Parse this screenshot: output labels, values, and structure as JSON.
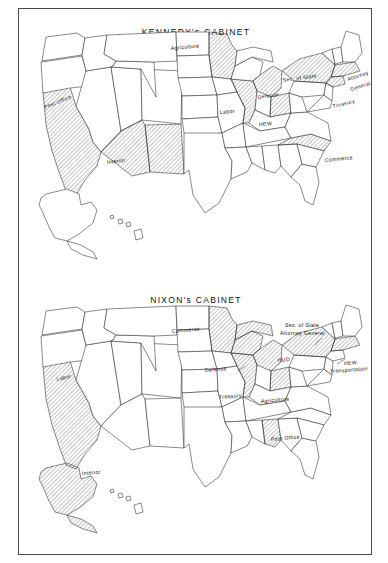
{
  "page": {
    "background": "#ffffff",
    "frame_color": "#4a4a4a",
    "hatch_color": "#555555",
    "outline_color": "#2b2b2b"
  },
  "maps": [
    {
      "id": "kennedy",
      "title": "KENNEDY's CABINET",
      "year": "1960",
      "labels": [
        {
          "name": "agriculture",
          "text": "Agriculture",
          "x": 152,
          "y": 41,
          "rot": -5,
          "state": "MN"
        },
        {
          "name": "post-office",
          "text": "Post Office",
          "x": 26,
          "y": 100,
          "rot": -22,
          "state": "CA"
        },
        {
          "name": "interior",
          "text": "Interior",
          "x": 88,
          "y": 155,
          "rot": -7,
          "state": "AZ-NM"
        },
        {
          "name": "labor",
          "text": "Labor",
          "x": 201,
          "y": 105,
          "rot": -5,
          "state": "IL"
        },
        {
          "name": "defense",
          "text": "Defense",
          "x": 239,
          "y": 90,
          "rot": -8,
          "state": "MI"
        },
        {
          "name": "hew",
          "text": "HEW",
          "x": 240,
          "y": 117,
          "rot": -3,
          "state": "OH"
        },
        {
          "name": "sec-of-state",
          "text": "Sec. of State",
          "x": 264,
          "y": 73,
          "rot": -8,
          "state": "NY"
        },
        {
          "name": "attorney-general",
          "text": "Attorney",
          "x": 329,
          "y": 72,
          "rot": -18,
          "state": "MA"
        },
        {
          "name": "attorney-general-2",
          "text": "General",
          "x": 332,
          "y": 82,
          "rot": -18,
          "state": "MA"
        },
        {
          "name": "treasury",
          "text": "Treasury",
          "x": 314,
          "y": 99,
          "rot": -14,
          "state": "CT"
        },
        {
          "name": "commerce",
          "text": "Commerce",
          "x": 306,
          "y": 153,
          "rot": -6,
          "state": "NC"
        }
      ],
      "shaded_states": [
        "CA",
        "AZ",
        "NM",
        "MN",
        "IL",
        "MI",
        "OH",
        "NY",
        "MA",
        "CT",
        "NC"
      ]
    },
    {
      "id": "nixon",
      "title": "NIXON's CABINET",
      "year": "1968",
      "labels": [
        {
          "name": "commerce",
          "text": "Commerce",
          "x": 153,
          "y": 324,
          "rot": -5,
          "state": "MN"
        },
        {
          "name": "labor",
          "text": "Labor",
          "x": 38,
          "y": 372,
          "rot": -14,
          "state": "CA"
        },
        {
          "name": "defense",
          "text": "Defense",
          "x": 186,
          "y": 363,
          "rot": -5,
          "state": "WI"
        },
        {
          "name": "treasury",
          "text": "Treasury",
          "x": 200,
          "y": 390,
          "rot": -5,
          "state": "IL"
        },
        {
          "name": "hud",
          "text": "HUD",
          "x": 259,
          "y": 353,
          "rot": -5,
          "state": "MI"
        },
        {
          "name": "agriculture",
          "text": "Agriculture",
          "x": 242,
          "y": 394,
          "rot": -5,
          "state": "OH"
        },
        {
          "name": "sec-of-state",
          "text": "Sec. of State",
          "x": 266,
          "y": 318,
          "rot": 0,
          "state": "NY"
        },
        {
          "name": "attorney-general",
          "text": "Attorney General",
          "x": 262,
          "y": 326,
          "rot": 0,
          "state": "NY"
        },
        {
          "name": "hew",
          "text": "HEW",
          "x": 325,
          "y": 356,
          "rot": -4,
          "state": "MA"
        },
        {
          "name": "transportation",
          "text": "Transportation",
          "x": 312,
          "y": 364,
          "rot": -4,
          "state": "MA"
        },
        {
          "name": "post-office",
          "text": "Post Office",
          "x": 252,
          "y": 432,
          "rot": -5,
          "state": "AL"
        },
        {
          "name": "interior",
          "text": "Interior",
          "x": 63,
          "y": 466,
          "rot": -4,
          "state": "AK"
        }
      ],
      "shaded_states": [
        "CA",
        "MN",
        "WI",
        "IL",
        "MI",
        "OH",
        "NY",
        "MA",
        "AL",
        "AK"
      ]
    }
  ]
}
